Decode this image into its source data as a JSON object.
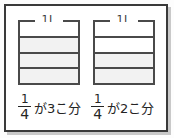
{
  "figure": {
    "frame_color": "#3a3a3a",
    "line_color": "#4a4a4a",
    "fill_color": "#f2f2f2",
    "text_color": "#242424"
  },
  "panels": [
    {
      "id": "left",
      "capacity_label": "1L",
      "divisions": 4,
      "bands": [
        {
          "index": 1,
          "filled": false
        },
        {
          "index": 2,
          "filled": true
        },
        {
          "index": 3,
          "filled": true
        },
        {
          "index": 4,
          "filled": true
        }
      ],
      "caption": {
        "numerator": "1",
        "denominator": "4",
        "text": "が3こ分"
      }
    },
    {
      "id": "right",
      "capacity_label": "1L",
      "divisions": 4,
      "bands": [
        {
          "index": 1,
          "filled": false
        },
        {
          "index": 2,
          "filled": false
        },
        {
          "index": 3,
          "filled": true
        },
        {
          "index": 4,
          "filled": true
        }
      ],
      "caption": {
        "numerator": "1",
        "denominator": "4",
        "text": "が2こ分"
      }
    }
  ]
}
